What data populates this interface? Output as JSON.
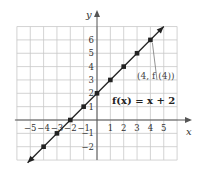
{
  "chart_data": {
    "type": "line",
    "title": "",
    "xlabel": "x",
    "ylabel": "y",
    "xlim": [
      -6,
      6
    ],
    "ylim": [
      -3,
      7
    ],
    "grid": true,
    "x_ticks": [
      -5,
      -4,
      -3,
      -2,
      -1,
      1,
      2,
      3,
      4,
      5
    ],
    "y_ticks": [
      -2,
      -1,
      1,
      2,
      3,
      4,
      5,
      6
    ],
    "x_tick_labels": [
      "−5",
      "−4",
      "−3",
      "−2",
      "−1",
      "1",
      "2",
      "3",
      "4",
      "5"
    ],
    "y_tick_labels": [
      "−2",
      "−1",
      "1",
      "2",
      "3",
      "4",
      "5",
      "6"
    ],
    "series": [
      {
        "name": "f(x) = x + 2",
        "equation": {
          "slope": 1,
          "intercept": 2
        },
        "line_extent_x": [
          -5.2,
          5.0
        ],
        "points": [
          {
            "x": -4,
            "y": -2
          },
          {
            "x": -3,
            "y": -1
          },
          {
            "x": -2,
            "y": 0
          },
          {
            "x": -1,
            "y": 1
          },
          {
            "x": 0,
            "y": 2
          },
          {
            "x": 1,
            "y": 3
          },
          {
            "x": 2,
            "y": 4
          },
          {
            "x": 3,
            "y": 5
          },
          {
            "x": 4,
            "y": 6
          }
        ]
      }
    ],
    "function_label": "f(x) = x + 2",
    "annotations": [
      {
        "text": "(4, f (4))",
        "points_to": {
          "x": 4,
          "y": 6
        }
      }
    ],
    "colors": {
      "line": "#222222",
      "grid": "#c8c8c8",
      "axis": "#555555"
    }
  }
}
